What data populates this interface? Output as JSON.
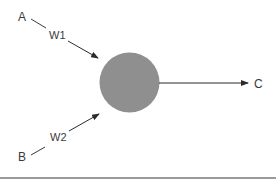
{
  "diagram": {
    "type": "perceptron-node",
    "inputs": [
      {
        "label": "A",
        "weight_label": "W1"
      },
      {
        "label": "B",
        "weight_label": "W2"
      }
    ],
    "output": {
      "label": "C"
    },
    "node": {
      "fill": "#8f8f8f"
    },
    "colors": {
      "line": "#3a3a3a",
      "text": "#3a3a3a",
      "rule": "#9a9a9a"
    }
  }
}
